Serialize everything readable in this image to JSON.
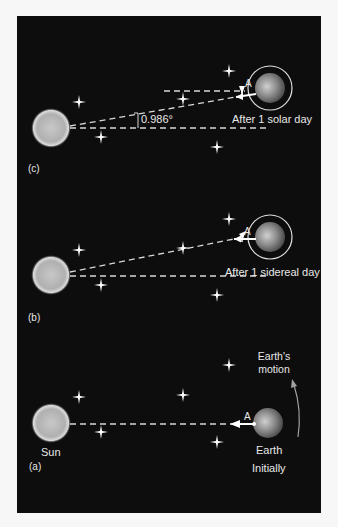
{
  "diagram": {
    "colors": {
      "background": "#0d0d0d",
      "page": "#f7f7f7",
      "text": "#e8e8e8",
      "line": "#d8d8d8"
    },
    "panels": [
      {
        "id": "c",
        "label": "(c)",
        "caption": "After 1 solar day",
        "angle_label": "0.986°",
        "point_label": "A"
      },
      {
        "id": "b",
        "label": "(b)",
        "caption": "After 1 sidereal day",
        "point_label": "A"
      },
      {
        "id": "a",
        "label": "(a)",
        "caption": "Initially",
        "sun_label": "Sun",
        "earth_label": "Earth",
        "motion_label_line1": "Earth's",
        "motion_label_line2": "motion",
        "point_label": "A"
      }
    ]
  }
}
